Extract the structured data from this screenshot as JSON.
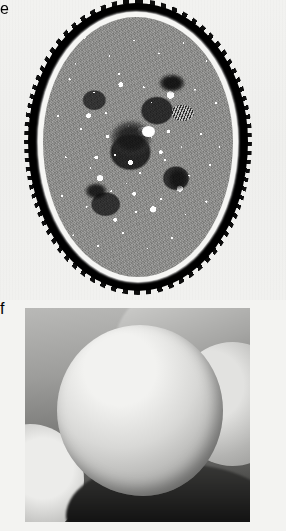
{
  "figure": {
    "background_color": "#f3f3f1",
    "panels": [
      {
        "id": "e",
        "label": "e",
        "label_color_bg": "#0b0b0b",
        "label_color_fg": "#ffffff",
        "technique": "TEM",
        "subject": "Oval spore cross-section with spiny outer wall and granular cytoplasm containing lipid droplets",
        "features": {
          "outer_wall": "dark spiny echinate wall",
          "membrane_ring": "thin bright intine ring",
          "cytoplasm": "granular with numerous white lipid droplets",
          "organelles": "several dark electron-dense bodies"
        }
      },
      {
        "id": "f",
        "label": "f",
        "label_color_bg": "#0b0b0b",
        "label_color_fg": "#ffffff",
        "technique": "SEM",
        "subject": "Reticulate pollen grains with honeycomb-patterned exine",
        "features": {
          "main_grain": "central spheroidal grain with coarse reticulum",
          "adjacent_grains": "partial grains at left, right and upper background",
          "surface": "muri ridges separating dark lumina"
        }
      }
    ]
  }
}
